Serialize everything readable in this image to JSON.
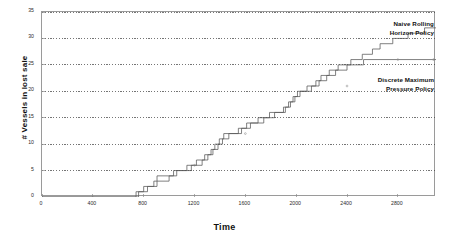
{
  "chart_data": {
    "type": "line",
    "title": "",
    "xlabel": "Time",
    "ylabel": "# Vessels in lost sale",
    "xlim": [
      0,
      3100
    ],
    "ylim": [
      0,
      35
    ],
    "grid": "horizontal-dotted",
    "legend_position": "inline-annotations",
    "xticks": [
      0,
      400,
      800,
      1200,
      1600,
      2000,
      2400,
      2800
    ],
    "yticks": [
      0,
      5,
      10,
      15,
      20,
      25,
      30,
      35
    ],
    "annotations": [
      {
        "name": "naive-rolling-horizon-policy",
        "text_line1": "Naive Rolling",
        "text_line2": "Horizon Policy"
      },
      {
        "name": "discrete-maximum-pressure-policy",
        "text_line1": "Discrete Maximum",
        "text_line2": "Pressure Policy"
      }
    ],
    "series": [
      {
        "name": "Naive Rolling Horizon Policy",
        "color": "#555555",
        "style": "step",
        "points": [
          [
            0,
            0
          ],
          [
            740,
            0
          ],
          [
            740,
            1
          ],
          [
            800,
            1
          ],
          [
            800,
            2
          ],
          [
            880,
            2
          ],
          [
            880,
            3
          ],
          [
            905,
            3
          ],
          [
            905,
            4
          ],
          [
            1035,
            4
          ],
          [
            1035,
            5
          ],
          [
            1140,
            5
          ],
          [
            1140,
            6
          ],
          [
            1215,
            6
          ],
          [
            1215,
            7
          ],
          [
            1280,
            7
          ],
          [
            1280,
            8
          ],
          [
            1330,
            8
          ],
          [
            1330,
            9
          ],
          [
            1360,
            9
          ],
          [
            1360,
            10
          ],
          [
            1395,
            10
          ],
          [
            1395,
            11
          ],
          [
            1430,
            11
          ],
          [
            1430,
            12
          ],
          [
            1545,
            12
          ],
          [
            1545,
            13
          ],
          [
            1610,
            13
          ],
          [
            1610,
            14
          ],
          [
            1700,
            14
          ],
          [
            1700,
            15
          ],
          [
            1790,
            15
          ],
          [
            1790,
            16
          ],
          [
            1900,
            16
          ],
          [
            1900,
            17
          ],
          [
            1940,
            17
          ],
          [
            1940,
            18
          ],
          [
            1975,
            18
          ],
          [
            1975,
            19
          ],
          [
            2010,
            19
          ],
          [
            2010,
            20
          ],
          [
            2085,
            20
          ],
          [
            2085,
            21
          ],
          [
            2155,
            21
          ],
          [
            2155,
            22
          ],
          [
            2195,
            22
          ],
          [
            2195,
            23
          ],
          [
            2260,
            23
          ],
          [
            2260,
            24
          ],
          [
            2330,
            24
          ],
          [
            2330,
            25
          ],
          [
            2430,
            25
          ],
          [
            2430,
            26
          ],
          [
            2520,
            26
          ],
          [
            2520,
            27
          ],
          [
            2600,
            27
          ],
          [
            2600,
            28
          ],
          [
            2660,
            28
          ],
          [
            2660,
            29
          ],
          [
            2760,
            29
          ],
          [
            2760,
            30
          ],
          [
            2880,
            30
          ],
          [
            2880,
            31
          ],
          [
            3010,
            31
          ],
          [
            3010,
            32
          ],
          [
            3100,
            32
          ]
        ]
      },
      {
        "name": "Discrete Maximum Pressure Policy",
        "color": "#555555",
        "style": "step",
        "points": [
          [
            0,
            0
          ],
          [
            760,
            0
          ],
          [
            760,
            1
          ],
          [
            830,
            1
          ],
          [
            830,
            2
          ],
          [
            905,
            2
          ],
          [
            905,
            3
          ],
          [
            1000,
            3
          ],
          [
            1000,
            4
          ],
          [
            1060,
            4
          ],
          [
            1060,
            5
          ],
          [
            1175,
            5
          ],
          [
            1175,
            6
          ],
          [
            1260,
            6
          ],
          [
            1260,
            7
          ],
          [
            1305,
            7
          ],
          [
            1305,
            8
          ],
          [
            1345,
            8
          ],
          [
            1345,
            9
          ],
          [
            1385,
            9
          ],
          [
            1385,
            10
          ],
          [
            1420,
            10
          ],
          [
            1420,
            11
          ],
          [
            1470,
            11
          ],
          [
            1470,
            12
          ],
          [
            1570,
            12
          ],
          [
            1570,
            13
          ],
          [
            1640,
            13
          ],
          [
            1640,
            14
          ],
          [
            1745,
            14
          ],
          [
            1745,
            15
          ],
          [
            1830,
            15
          ],
          [
            1830,
            16
          ],
          [
            1915,
            16
          ],
          [
            1915,
            17
          ],
          [
            1955,
            17
          ],
          [
            1955,
            18
          ],
          [
            1990,
            18
          ],
          [
            1990,
            19
          ],
          [
            2030,
            19
          ],
          [
            2030,
            20
          ],
          [
            2120,
            20
          ],
          [
            2120,
            21
          ],
          [
            2180,
            21
          ],
          [
            2180,
            22
          ],
          [
            2240,
            22
          ],
          [
            2240,
            23
          ],
          [
            2310,
            23
          ],
          [
            2310,
            24
          ],
          [
            2400,
            24
          ],
          [
            2400,
            25
          ],
          [
            2530,
            25
          ],
          [
            2530,
            26
          ],
          [
            3100,
            26
          ]
        ]
      }
    ]
  },
  "axis": {
    "y_title": "# Vessels in lost sale",
    "x_title": "Time",
    "y_tick_labels": [
      "0",
      "5",
      "10",
      "15",
      "20",
      "25",
      "30",
      "35"
    ],
    "x_tick_labels": [
      "0",
      "400",
      "800",
      "1200",
      "1600",
      "2000",
      "2400",
      "2800"
    ]
  },
  "annotations": {
    "naive": {
      "line1": "Naive Rolling",
      "line2": "Horizon Policy"
    },
    "dmp": {
      "line1": "Discrete Maximum",
      "line2": "Pressure Policy"
    }
  },
  "colors": {
    "series": "#555555",
    "grid": "#3a3a3a",
    "frame": "#9a9a9a",
    "text": "#1a1a1a",
    "background": "#ffffff"
  }
}
